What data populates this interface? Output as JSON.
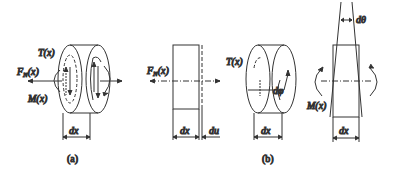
{
  "figure": {
    "panels": [
      {
        "id": "a",
        "caption": "(a)",
        "labels": {
          "torque": "T(x)",
          "axial_force": "F",
          "axial_force_sub": "N",
          "axial_force_arg": "(x)",
          "moment": "M(x)",
          "width": "dx"
        }
      },
      {
        "id": "b",
        "caption": "(b)",
        "subfigures": [
          {
            "id": "b1",
            "labels": {
              "axial_force": "F",
              "axial_force_sub": "N",
              "axial_force_arg": "(x)",
              "width": "dx",
              "elongation": "du"
            }
          },
          {
            "id": "b2",
            "labels": {
              "torque": "T(x)",
              "twist": "dφ",
              "width": "dx"
            }
          },
          {
            "id": "b3",
            "labels": {
              "rotation": "dθ",
              "moment": "M(x)",
              "width": "dx"
            }
          }
        ]
      }
    ],
    "colors": {
      "line": "#333333",
      "background": "#ffffff"
    }
  }
}
